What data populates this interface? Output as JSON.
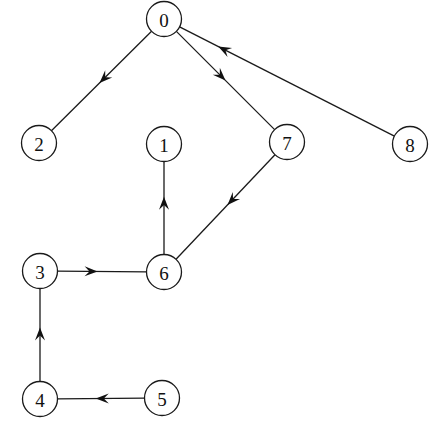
{
  "diagram": {
    "background_color": "#ffffff",
    "stroke_color": "#1a1a1a",
    "node_fill_color": "#ffffff",
    "label_color": "#111111",
    "node_radius": 17.5,
    "nodes": [
      {
        "id": "0",
        "label": "0",
        "cx": 164,
        "cy": 19
      },
      {
        "id": "1",
        "label": "1",
        "cx": 164,
        "cy": 144
      },
      {
        "id": "2",
        "label": "2",
        "cx": 39,
        "cy": 143
      },
      {
        "id": "3",
        "label": "3",
        "cx": 40,
        "cy": 271
      },
      {
        "id": "4",
        "label": "4",
        "cx": 40,
        "cy": 399
      },
      {
        "id": "5",
        "label": "5",
        "cx": 162,
        "cy": 398
      },
      {
        "id": "6",
        "label": "6",
        "cx": 164,
        "cy": 272
      },
      {
        "id": "7",
        "label": "7",
        "cx": 287,
        "cy": 142
      },
      {
        "id": "8",
        "label": "8",
        "cx": 410,
        "cy": 144
      }
    ],
    "edges": [
      {
        "id": "e-0-2",
        "from": "0",
        "to": "2",
        "directed": true,
        "arrow_t": 0.52
      },
      {
        "id": "e-0-7",
        "from": "0",
        "to": "7",
        "directed": true,
        "arrow_t": 0.5
      },
      {
        "id": "e-8-0",
        "from": "8",
        "to": "0",
        "directed": true,
        "arrow_t": 0.82
      },
      {
        "id": "e-7-6",
        "from": "7",
        "to": "6",
        "directed": true,
        "arrow_t": 0.48
      },
      {
        "id": "e-6-1",
        "from": "6",
        "to": "1",
        "directed": true,
        "arrow_t": 0.62
      },
      {
        "id": "e-3-6",
        "from": "3",
        "to": "6",
        "directed": true,
        "arrow_t": 0.45
      },
      {
        "id": "e-4-3",
        "from": "4",
        "to": "3",
        "directed": true,
        "arrow_t": 0.58
      },
      {
        "id": "e-5-4",
        "from": "5",
        "to": "4",
        "directed": true,
        "arrow_t": 0.56
      }
    ]
  }
}
